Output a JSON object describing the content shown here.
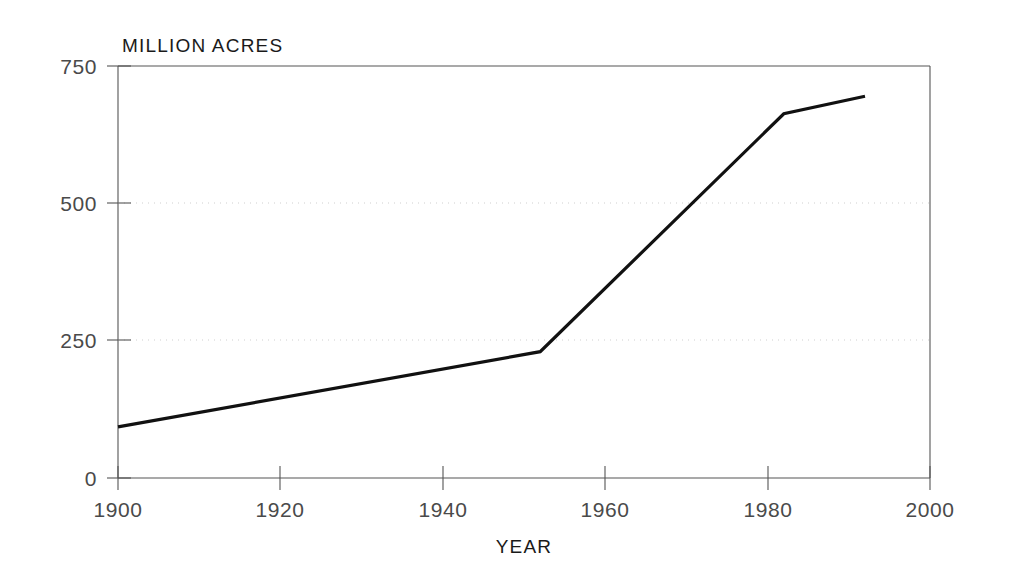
{
  "chart_data": {
    "type": "line",
    "title": "MILLION ACRES",
    "xlabel": "YEAR",
    "ylabel": "MILLION ACRES",
    "xlim": [
      1900,
      2000
    ],
    "ylim": [
      0,
      750
    ],
    "x_ticks": [
      1900,
      1920,
      1940,
      1960,
      1980,
      2000
    ],
    "y_ticks": [
      0,
      250,
      500,
      750
    ],
    "grid": "horizontal dotted at 250 and 500",
    "legend": "none",
    "series": [
      {
        "name": "Irrigated area",
        "x": [
          1900,
          1952,
          1982,
          1992
        ],
        "values": [
          93,
          230,
          663,
          695
        ]
      }
    ]
  },
  "labels": {
    "title": "MILLION ACRES",
    "xlabel": "YEAR",
    "y_ticks": [
      "0",
      "250",
      "500",
      "750"
    ],
    "x_ticks": [
      "1900",
      "1920",
      "1940",
      "1960",
      "1980",
      "2000"
    ]
  },
  "colors": {
    "line": "#111111",
    "frame": "#555555",
    "grid": "#c9c9c9",
    "background": "#ffffff",
    "tick_text": "#4a4a4a"
  }
}
